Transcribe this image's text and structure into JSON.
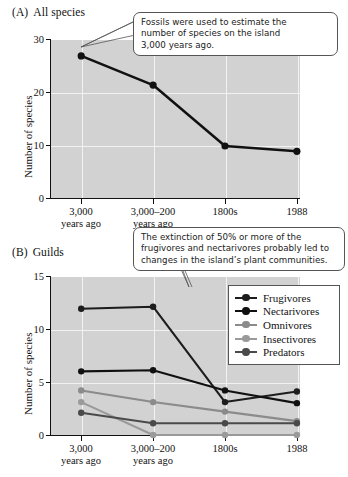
{
  "figure": {
    "panels": [
      {
        "tag": "(A)",
        "title": "All species",
        "ylabel": "Number of species",
        "yticks": [
          "0",
          "10",
          "20",
          "30"
        ],
        "xticks": [
          {
            "line1": "3,000",
            "line2": "years ago"
          },
          {
            "line1": "3,000–200",
            "line2": "years ago"
          },
          {
            "line1": "1800s",
            "line2": ""
          },
          {
            "line1": "1988",
            "line2": ""
          }
        ],
        "callout": {
          "lines": [
            "Fossils were used to estimate the",
            "number of species on the island",
            "3,000 years ago."
          ]
        }
      },
      {
        "tag": "(B)",
        "title": "Guilds",
        "ylabel": "Number of species",
        "yticks": [
          "0",
          "5",
          "10",
          "15"
        ],
        "xticks": [
          {
            "line1": "3,000",
            "line2": "years ago"
          },
          {
            "line1": "3,000–200",
            "line2": "years ago"
          },
          {
            "line1": "1800s",
            "line2": ""
          },
          {
            "line1": "1988",
            "line2": ""
          }
        ],
        "callout": {
          "lines": [
            "The extinction of 50% or more of the",
            "frugivores and nectarivores probably led to",
            "changes in the island’s plant communities."
          ]
        },
        "legend": {
          "items": [
            {
              "label": "Frugivores",
              "color": "#1d1d1d"
            },
            {
              "label": "Nectarivores",
              "color": "#101010"
            },
            {
              "label": "Omnivores",
              "color": "#8b8b8b"
            },
            {
              "label": "Insectivores",
              "color": "#9a9a9a"
            },
            {
              "label": "Predators",
              "color": "#4a4a4a"
            }
          ]
        }
      }
    ]
  },
  "chart_data": [
    {
      "type": "line",
      "title": "All species",
      "xlabel": "",
      "ylabel": "Number of species",
      "categories": [
        "3,000 years ago",
        "3,000–200 years ago",
        "1800s",
        "1988"
      ],
      "values": [
        27,
        21.5,
        10,
        9
      ],
      "ylim": [
        0,
        30
      ],
      "yticks": [
        0,
        10,
        20,
        30
      ],
      "grid": true,
      "legend": "none",
      "annotations": [
        "Fossils were used to estimate the number of species on the island 3,000 years ago."
      ]
    },
    {
      "type": "line",
      "title": "Guilds",
      "xlabel": "",
      "ylabel": "Number of species",
      "categories": [
        "3,000 years ago",
        "3,000–200 years ago",
        "1800s",
        "1988"
      ],
      "ylim": [
        0,
        15
      ],
      "yticks": [
        0,
        5,
        10,
        15
      ],
      "grid": true,
      "legend": "upper right",
      "series": [
        {
          "name": "Frugivores",
          "values": [
            12,
            12.2,
            3.2,
            4.2
          ],
          "color": "#1d1d1d"
        },
        {
          "name": "Nectarivores",
          "values": [
            6.1,
            6.2,
            4.3,
            3.1
          ],
          "color": "#101010"
        },
        {
          "name": "Omnivores",
          "values": [
            4.3,
            3.2,
            2.3,
            1.4
          ],
          "color": "#8b8b8b"
        },
        {
          "name": "Insectivores",
          "values": [
            3.2,
            0.1,
            0.1,
            0.1
          ],
          "color": "#9a9a9a"
        },
        {
          "name": "Predators",
          "values": [
            2.2,
            1.2,
            1.2,
            1.2
          ],
          "color": "#4a4a4a"
        }
      ],
      "annotations": [
        "The extinction of 50% or more of the frugivores and nectarivores probably led to changes in the island’s plant communities."
      ]
    }
  ]
}
